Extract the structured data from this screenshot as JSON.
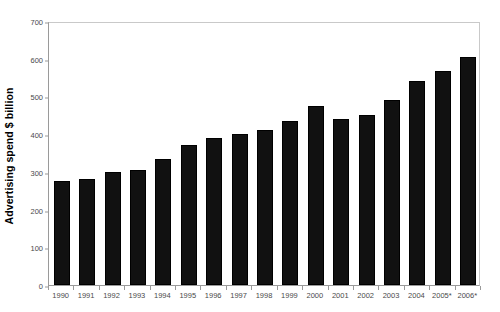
{
  "chart_data": {
    "type": "bar",
    "title": "",
    "xlabel": "",
    "ylabel": "Advertising spend $ billion",
    "categories": [
      "1990",
      "1991",
      "1992",
      "1993",
      "1994",
      "1995",
      "1996",
      "1997",
      "1998",
      "1999",
      "2000",
      "2001",
      "2002",
      "2003",
      "2004",
      "2005*",
      "2006*"
    ],
    "values": [
      275,
      282,
      300,
      305,
      333,
      371,
      389,
      400,
      411,
      435,
      474,
      440,
      450,
      490,
      541,
      568,
      605
    ],
    "ylim": [
      0,
      700
    ],
    "yticks": [
      0,
      100,
      200,
      300,
      400,
      500,
      600,
      700
    ],
    "ytick_labels": [
      "0",
      "100",
      "200",
      "300",
      "400",
      "500",
      "600",
      "700"
    ],
    "grid": false,
    "legend": "none",
    "bar_color": "#111111",
    "series_name": "Advertising spend"
  },
  "axes": {
    "y_title": "Advertising spend $ billion",
    "axis_line_color": "#9a9a9a",
    "tick_label_color": "#4a4a4a"
  }
}
